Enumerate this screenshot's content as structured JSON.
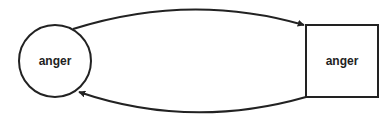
{
  "diagram": {
    "nodes": [
      {
        "id": "circle-node",
        "shape": "circle",
        "label": "anger"
      },
      {
        "id": "square-node",
        "shape": "square",
        "label": "anger"
      }
    ],
    "edges": [
      {
        "from": "circle-node",
        "to": "square-node",
        "label": ""
      },
      {
        "from": "square-node",
        "to": "circle-node",
        "label": ""
      }
    ],
    "colors": {
      "stroke": "#222222",
      "background": "#ffffff"
    }
  }
}
